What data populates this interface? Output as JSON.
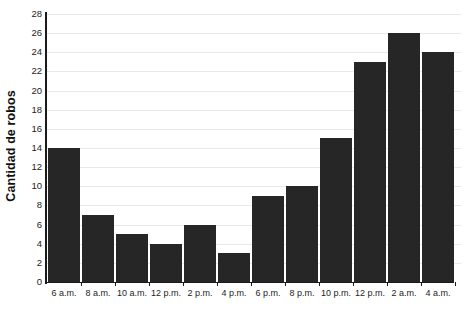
{
  "chart_data": {
    "type": "bar",
    "title": "",
    "subtitle": "",
    "xlabel": "",
    "ylabel": "Cantidad de robos",
    "categories": [
      "6 a.m.",
      "8 a.m.",
      "10 a.m.",
      "12 p.m.",
      "2 p.m.",
      "4 p.m.",
      "6 p.m.",
      "8 p.m.",
      "10 p.m.",
      "12 p.m.",
      "2 a.m.",
      "4 a.m."
    ],
    "values": [
      14,
      7,
      5,
      4,
      6,
      3,
      9,
      10,
      15,
      23,
      26,
      24
    ],
    "ylim": [
      0,
      28
    ],
    "ytick_step": 2,
    "ytick_labels": [
      "0",
      "2",
      "4",
      "6",
      "8",
      "10",
      "12",
      "14",
      "16",
      "18",
      "20",
      "22",
      "24",
      "26",
      "28"
    ],
    "grid": true,
    "grid_axis": "y",
    "legend": false,
    "legend_position": "none",
    "bar_color": "#262626",
    "grid_color": "#e9e9e9",
    "axis_color": "#1a1a1a",
    "background_color": "#ffffff"
  }
}
